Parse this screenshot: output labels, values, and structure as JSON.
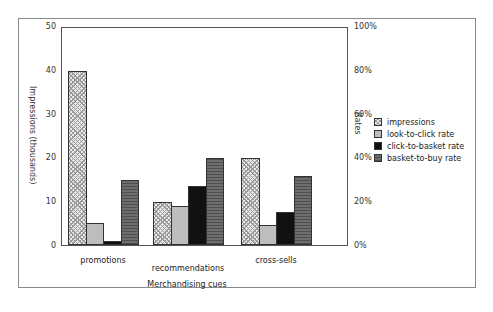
{
  "chart_data": {
    "type": "bar",
    "title": "",
    "xlabel": "Merchandising cues",
    "ylabel": "Impressions (thousands)",
    "y2label": "Rates",
    "categories": [
      "promotions",
      "recommendations",
      "cross-sells"
    ],
    "series": [
      {
        "name": "impressions",
        "axis": "left",
        "values": [
          40,
          10,
          20
        ]
      },
      {
        "name": "look-to-click rate",
        "axis": "right",
        "values": [
          10,
          18,
          9
        ]
      },
      {
        "name": "click-to-basket rate",
        "axis": "right",
        "values": [
          2,
          27,
          15
        ]
      },
      {
        "name": "basket-to-buy rate",
        "axis": "right",
        "values": [
          30,
          40,
          32
        ]
      }
    ],
    "ylim": [
      0,
      50
    ],
    "y2lim": [
      0,
      100
    ],
    "yticks": [
      "0",
      "10",
      "20",
      "30",
      "40",
      "50"
    ],
    "y2ticks": [
      "0%",
      "20%",
      "40%",
      "60%",
      "80%",
      "100%"
    ],
    "legend_position": "right",
    "grid": false
  },
  "legend": {
    "items": [
      {
        "label": "impressions",
        "pattern": "crosshatch-light"
      },
      {
        "label": "look-to-click rate",
        "pattern": "solid-light-gray"
      },
      {
        "label": "click-to-basket rate",
        "pattern": "solid-black"
      },
      {
        "label": "basket-to-buy rate",
        "pattern": "striped-dark-gray"
      }
    ]
  },
  "colors": {
    "impressions": "#e8e8e8",
    "look_to_click": "#bdbdbd",
    "click_to_basket": "#111111",
    "basket_to_buy": "#6e6e6e"
  }
}
